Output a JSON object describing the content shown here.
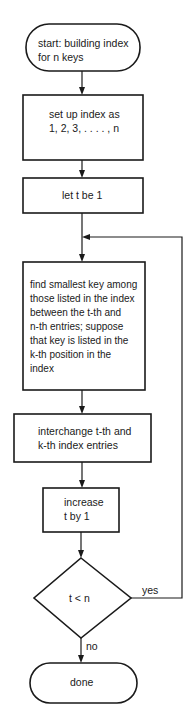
{
  "flowchart": {
    "nodes": [
      {
        "id": "start",
        "type": "terminal",
        "text": "start: building index\nfor n keys"
      },
      {
        "id": "setup",
        "type": "process",
        "text": "set up index as\n1, 2, 3, . . . . , n"
      },
      {
        "id": "init_t",
        "type": "process",
        "text": "let t be 1"
      },
      {
        "id": "find_min",
        "type": "process",
        "text": "find smallest key among\nthose listed in the index\nbetween the t-th and\nn-th entries; suppose\nthat key is listed in the\nk-th position in the\nindex"
      },
      {
        "id": "swap",
        "type": "process",
        "text": "interchange t-th and\nk-th index entries"
      },
      {
        "id": "increment",
        "type": "process",
        "text": "increase\nt by 1"
      },
      {
        "id": "test",
        "type": "decision",
        "text": "t < n"
      },
      {
        "id": "done",
        "type": "terminal",
        "text": "done"
      }
    ],
    "edges": [
      {
        "from": "start",
        "to": "setup",
        "label": ""
      },
      {
        "from": "setup",
        "to": "init_t",
        "label": ""
      },
      {
        "from": "init_t",
        "to": "find_min",
        "label": ""
      },
      {
        "from": "find_min",
        "to": "swap",
        "label": ""
      },
      {
        "from": "swap",
        "to": "increment",
        "label": ""
      },
      {
        "from": "increment",
        "to": "test",
        "label": ""
      },
      {
        "from": "test",
        "to": "find_min",
        "label": "yes"
      },
      {
        "from": "test",
        "to": "done",
        "label": "no"
      }
    ]
  }
}
